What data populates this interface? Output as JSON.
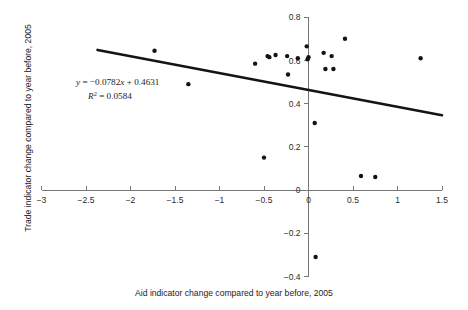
{
  "chart_data": {
    "type": "scatter",
    "title": "",
    "xlabel": "Aid indicator change compared to year before, 2005",
    "ylabel": "Trade indicator change compared to year before, 2005",
    "xlim": [
      -3,
      1.5
    ],
    "ylim": [
      -0.4,
      0.8
    ],
    "xticks": [
      "-3",
      "-2.5",
      "-2",
      "-1.5",
      "-1",
      "-0.5",
      "0",
      "0.5",
      "1",
      "1.5"
    ],
    "xtick_values": [
      -3,
      -2.5,
      -2,
      -1.5,
      -1,
      -0.5,
      0,
      0.5,
      1,
      1.5
    ],
    "yticks": [
      "0.8",
      "0.6",
      "0.4",
      "0.2",
      "0",
      "-0.2",
      "-0.4"
    ],
    "ytick_values": [
      0.8,
      0.6,
      0.4,
      0.2,
      0,
      -0.2,
      -0.4
    ],
    "grid": false,
    "legend": "none",
    "point_color": "#141414",
    "trendline_color": "#141414",
    "axis_color": "#767676",
    "x": [
      -1.73,
      -1.35,
      -0.6,
      -0.5,
      -0.46,
      -0.44,
      -0.37,
      -0.24,
      -0.23,
      -0.12,
      -0.02,
      -0.01,
      0.0,
      0.07,
      0.08,
      0.17,
      0.19,
      0.26,
      0.28,
      0.41,
      0.59,
      0.75,
      1.26
    ],
    "y": [
      0.645,
      0.49,
      0.585,
      0.15,
      0.62,
      0.615,
      0.625,
      0.62,
      0.535,
      0.61,
      0.665,
      0.605,
      0.615,
      0.31,
      -0.31,
      0.635,
      0.56,
      0.62,
      0.56,
      0.7,
      0.065,
      0.06,
      0.61
    ],
    "trendline": {
      "slope": -0.0782,
      "intercept": 0.4631,
      "r_squared": 0.0584,
      "x_start": -2.37,
      "x_end": 1.5
    },
    "annotations": {
      "equation_y": "y",
      "equation_body": " = −0.0782",
      "equation_x": "x",
      "equation_tail": " + 0.4631",
      "r_symbol": "R",
      "r_exponent": "2",
      "r_value": " = 0.0584"
    }
  }
}
